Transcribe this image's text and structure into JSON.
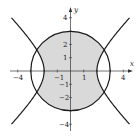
{
  "diagram": {
    "type": "conic-region-plot",
    "axes": {
      "x_label": "x",
      "y_label": "y",
      "x_ticks": [
        {
          "value": -4,
          "label": "−4"
        },
        {
          "value": -1,
          "label": "−1"
        },
        {
          "value": 1,
          "label": "1"
        },
        {
          "value": 4,
          "label": "4"
        }
      ],
      "y_ticks": [
        {
          "value": 4,
          "label": "4"
        },
        {
          "value": 2,
          "label": "2"
        },
        {
          "value": 1,
          "label": "1"
        },
        {
          "value": -1,
          "label": "−1"
        },
        {
          "value": -2,
          "label": "−2"
        },
        {
          "value": -4,
          "label": "−4"
        }
      ],
      "range": [
        -4.5,
        4.5
      ]
    },
    "curves": [
      {
        "name": "circle",
        "equation": "x^2 + y^2 = 9",
        "radius": 3
      },
      {
        "name": "hyperbola",
        "equation": "x^2 - y^2 = 4",
        "vertices": [
          -2,
          2
        ]
      }
    ],
    "shaded_region": {
      "description": "inside circle and between hyperbola branches",
      "fill": "#d9d9d9"
    },
    "colors": {
      "curve": "#1a1a1a",
      "axis": "#333333",
      "fill": "#d9d9d9"
    }
  }
}
